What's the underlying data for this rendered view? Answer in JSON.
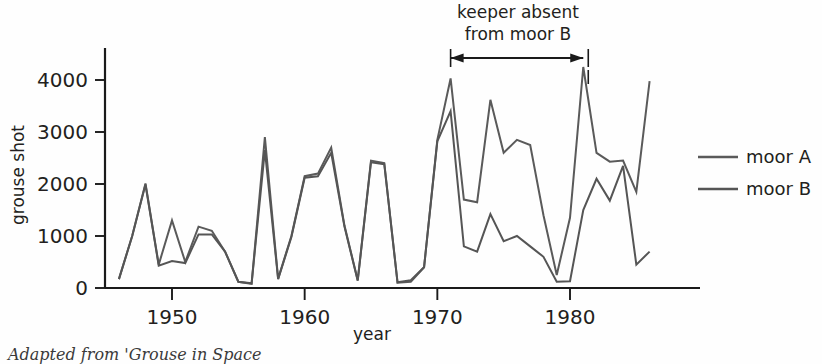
{
  "figure": {
    "caption": "Adapted from 'Grouse in Space"
  },
  "legend": {
    "position": "right",
    "entries": [
      {
        "label": "moor A",
        "color": "#5a5a5a"
      },
      {
        "label": "moor B",
        "color": "#555555"
      }
    ]
  },
  "annotation": {
    "line1": "keeper absent",
    "line2": "from moor B",
    "arrow_from_year": 1971,
    "arrow_to_year": 1981
  },
  "chart_data": {
    "type": "line",
    "title": "",
    "xlabel": "year",
    "ylabel": "grouse shot",
    "xlim": [
      1946,
      1986
    ],
    "ylim": [
      0,
      4500
    ],
    "xticks": [
      1950,
      1960,
      1970,
      1980
    ],
    "yticks": [
      0,
      1000,
      2000,
      3000,
      4000
    ],
    "grid": false,
    "x": [
      1946,
      1947,
      1948,
      1949,
      1950,
      1951,
      1952,
      1953,
      1954,
      1955,
      1956,
      1957,
      1958,
      1959,
      1960,
      1961,
      1962,
      1963,
      1964,
      1965,
      1966,
      1967,
      1968,
      1969,
      1970,
      1971,
      1972,
      1973,
      1974,
      1975,
      1976,
      1977,
      1978,
      1979,
      1980,
      1981,
      1982,
      1983,
      1984,
      1985,
      1986
    ],
    "series": [
      {
        "name": "moor A",
        "color": "#5a5a5a",
        "values": [
          170,
          1000,
          2010,
          450,
          1300,
          500,
          1180,
          1100,
          700,
          120,
          80,
          2900,
          180,
          1000,
          2150,
          2200,
          2700,
          1200,
          150,
          2450,
          2400,
          100,
          120,
          400,
          2850,
          4030,
          1700,
          1650,
          3620,
          2600,
          2850,
          2750,
          1400,
          250,
          1350,
          4250,
          2600,
          2430,
          2450,
          1850,
          3980
        ]
      },
      {
        "name": "moor B",
        "color": "#555555",
        "values": [
          170,
          1000,
          1990,
          430,
          520,
          480,
          1030,
          1030,
          700,
          120,
          90,
          2650,
          170,
          980,
          2120,
          2150,
          2600,
          1180,
          140,
          2420,
          2380,
          110,
          150,
          400,
          2820,
          3400,
          800,
          700,
          1420,
          900,
          1000,
          800,
          600,
          120,
          130,
          1500,
          2100,
          1680,
          2350,
          450,
          700
        ]
      }
    ]
  },
  "geometry": {
    "x_axis_pixel_left": 105,
    "x_axis_pixel_right": 660,
    "y_axis_pixel_top": 48,
    "y_axis_pixel_bottom": 288,
    "year_1950_px": 172,
    "year_1980_px": 570,
    "value_0_px": 288,
    "value_4000_px": 80
  }
}
